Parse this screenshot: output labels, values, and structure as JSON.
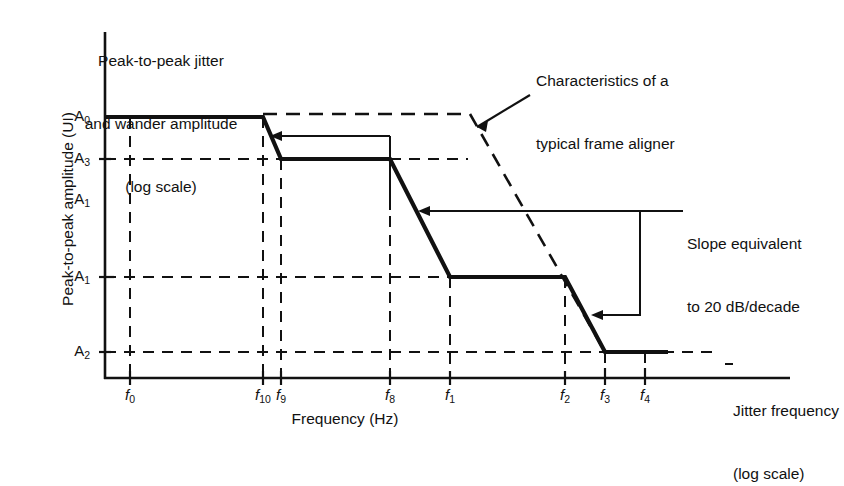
{
  "figure": {
    "title_lines": [
      "Peak-to-peak jitter",
      "and wander amplitude",
      "(log scale)"
    ],
    "y_axis_title": "Peak-to-peak amplitude (UI)",
    "x_axis_title": "Frequency (Hz)",
    "x_axis_side_label_lines": [
      "Jitter frequency",
      "(log scale)"
    ],
    "annotations": {
      "aligner_lines": [
        "Characteristics of a",
        "typical frame aligner"
      ],
      "slope_lines": [
        "Slope equivalent",
        "to 20 dB/decade"
      ]
    }
  },
  "chart_data": {
    "type": "line",
    "title": "Peak-to-peak jitter and wander amplitude (log scale)",
    "xlabel": "Frequency (Hz)",
    "ylabel": "Peak-to-peak amplitude (UI)",
    "x_scale": "log",
    "y_scale": "log",
    "grid": true,
    "legend": "none",
    "x_ticks": [
      {
        "label": "f0",
        "base": "f",
        "sub": "0",
        "px": 130
      },
      {
        "label": "f10",
        "base": "f",
        "sub": "10",
        "px": 263
      },
      {
        "label": "f9",
        "base": "f",
        "sub": "9",
        "px": 281
      },
      {
        "label": "f8",
        "base": "f",
        "sub": "8",
        "px": 390
      },
      {
        "label": "f1",
        "base": "f",
        "sub": "1",
        "px": 450
      },
      {
        "label": "f2",
        "base": "f",
        "sub": "2",
        "px": 565
      },
      {
        "label": "f3",
        "base": "f",
        "sub": "3",
        "px": 605
      },
      {
        "label": "f4",
        "base": "f",
        "sub": "4",
        "px": 645
      }
    ],
    "y_ticks": [
      {
        "label": "A0",
        "base": "A",
        "sub": "0",
        "px": 117
      },
      {
        "label": "A3",
        "base": "A",
        "sub": "3",
        "px": 159
      },
      {
        "label": "A1",
        "base": "A",
        "sub": "1",
        "px": 200
      },
      {
        "label": "A1",
        "base": "A",
        "sub": "1",
        "px": 277
      },
      {
        "label": "A2",
        "base": "A",
        "sub": "2",
        "px": 352
      }
    ],
    "series": [
      {
        "name": "Jitter tolerance mask",
        "style": "solid-bold",
        "points": [
          {
            "x": "axis-origin",
            "y": "A0"
          },
          {
            "x": "f10",
            "y": "A0"
          },
          {
            "x": "f9",
            "y": "A3"
          },
          {
            "x": "f8",
            "y": "A3"
          },
          {
            "x": "f1",
            "y": "A1-lower"
          },
          {
            "x": "f2",
            "y": "A1-lower"
          },
          {
            "x": "f3",
            "y": "A2"
          },
          {
            "x": "end",
            "y": "A2"
          }
        ]
      },
      {
        "name": "Typical frame aligner characteristic",
        "style": "dashed",
        "points": [
          {
            "x": "f10",
            "y": "A0"
          },
          {
            "x": "mid",
            "y": "A0"
          },
          {
            "x": "f3",
            "y": "A2"
          }
        ]
      }
    ],
    "slope_note": "20 dB/decade"
  }
}
